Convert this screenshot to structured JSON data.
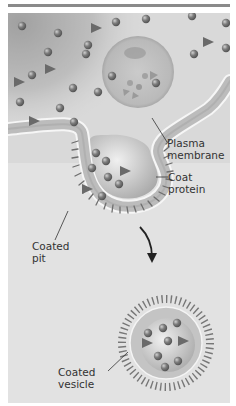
{
  "diagram": {
    "type": "endocytosis-illustration",
    "labels": {
      "plasma_membrane": "Plasma\nmembrane",
      "coat_protein": "Coat protein",
      "coated_pit": "Coated\npit",
      "coated_vesicle": "Coated\nvesicle"
    },
    "colors": {
      "background_dark": "#9a9a9a",
      "background_light": "#e6e6e6",
      "membrane": "#bdbdbd",
      "membrane_edge": "#f4f4f4",
      "molecule_sphere": "#7a7a7a",
      "molecule_triangle": "#6e6e6e",
      "coat_protein": "#707070",
      "label_text": "#333333"
    }
  }
}
